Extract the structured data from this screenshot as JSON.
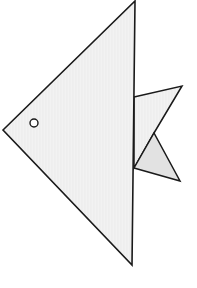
{
  "figure": {
    "background": "#ffffff",
    "stroke": "#1a1a1a",
    "body_fill": "#f1f1f1",
    "upper_fin_fill": "#f3f3f3",
    "lower_fin_fill": "#e2e2e2",
    "eye_fill": "#ffffff",
    "body_points": "3,130 135,1 132,265",
    "upper_fin_points": "134,97 182,86 154,133 134,168",
    "lower_fin_points": "134,168 154,133 180,181",
    "eye": {
      "cx": 34,
      "cy": 123,
      "r": 4
    }
  }
}
